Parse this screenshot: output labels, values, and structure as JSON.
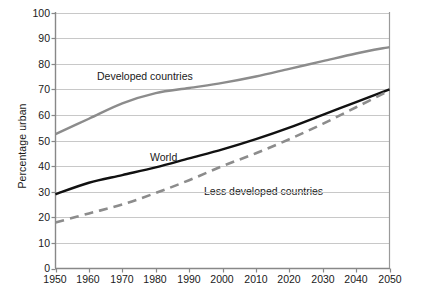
{
  "chart_data": {
    "type": "line",
    "title": "",
    "xlabel": "",
    "ylabel": "Percentage urban",
    "xlim": [
      1950,
      2050
    ],
    "ylim": [
      0,
      100
    ],
    "grid": true,
    "legend_position": "inline-annotations",
    "x": [
      1950,
      1960,
      1970,
      1980,
      1990,
      2000,
      2010,
      2020,
      2030,
      2040,
      2050
    ],
    "xticks": [
      "1950",
      "1960",
      "1970",
      "1980",
      "1990",
      "2000",
      "2010",
      "2020",
      "2030",
      "2040",
      "2050"
    ],
    "yticks": [
      "0",
      "10",
      "20",
      "30",
      "40",
      "50",
      "60",
      "70",
      "80",
      "90",
      "100"
    ],
    "series": [
      {
        "name": "Developed countries",
        "color": "#8c8c8c",
        "style": "solid",
        "label_x": 1974,
        "label_y": 76,
        "values": [
          52.5,
          58.5,
          64.5,
          68.5,
          70.5,
          72.5,
          75.0,
          78.0,
          81.0,
          84.0,
          86.5
        ]
      },
      {
        "name": "World",
        "color": "#111111",
        "style": "solid",
        "label_x": 1985,
        "label_y": 48,
        "values": [
          29.0,
          33.5,
          36.5,
          39.5,
          43.0,
          46.5,
          50.5,
          55.0,
          60.0,
          65.0,
          70.0
        ]
      },
      {
        "name": "Less developed countries",
        "color": "#8c8c8c",
        "style": "dashed",
        "label_x": 1998,
        "label_y": 34,
        "values": [
          18.0,
          21.5,
          25.0,
          29.5,
          34.5,
          40.0,
          45.0,
          50.5,
          56.5,
          63.0,
          69.5
        ]
      }
    ]
  }
}
